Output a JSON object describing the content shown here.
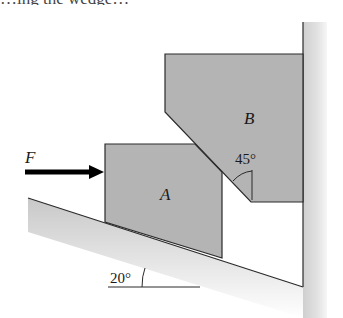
{
  "diagram": {
    "type": "statics-wedge-problem",
    "top_text_fragment": "…ing the wedge…",
    "labels": {
      "force": "F",
      "block_a": "A",
      "block_b": "B",
      "contact_angle": "45°",
      "incline_angle": "20°"
    },
    "colors": {
      "block_fill": "#b4b4b4",
      "outline": "#2a2a2a",
      "ground_shade": "#d6d6d6",
      "wall_shade": "#dcdcdc",
      "arrow": "#000000"
    },
    "elements": [
      {
        "id": "wall",
        "description": "vertical wall on right side"
      },
      {
        "id": "incline",
        "description": "ground inclined at 20° descending to the right"
      },
      {
        "id": "block_a",
        "description": "block A resting on the incline, pushed by F"
      },
      {
        "id": "block_b",
        "description": "block B against wall with 45° chamfered lower-left face contacting A"
      },
      {
        "id": "force_f",
        "description": "horizontal force arrow F pushing block A to the right"
      }
    ]
  }
}
